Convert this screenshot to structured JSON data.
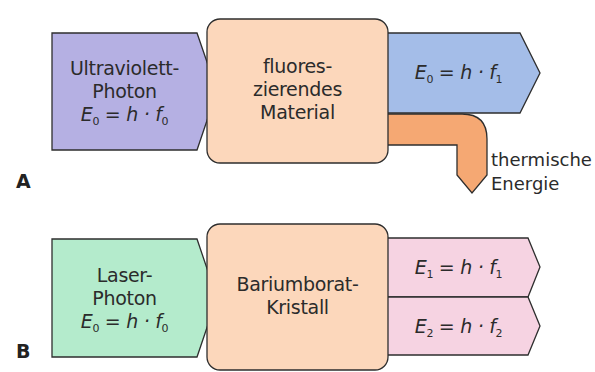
{
  "colors": {
    "uv_photon": "#b5b0e3",
    "material": "#fcd7bb",
    "emitted_photon": "#a4bde8",
    "thermal": "#f5a873",
    "laser_photon": "#b4ebcc",
    "output_photons": "#f6d3e2",
    "outline": "#2e2e2e"
  },
  "panel_a": {
    "label": "A",
    "input": {
      "line1": "Ultraviolett-",
      "line2": "Photon",
      "eq_var": "E",
      "eq_var_sub": "0",
      "eq_mid": " = h · ",
      "eq_f": "f",
      "eq_f_sub": "0"
    },
    "center": {
      "line1": "fluores-",
      "line2": "zierendes",
      "line3": "Material"
    },
    "output": {
      "eq_var": "E",
      "eq_var_sub": "0",
      "eq_mid": " = h · ",
      "eq_f": "f",
      "eq_f_sub": "1"
    },
    "thermal": {
      "line1": "thermische",
      "line2": "Energie"
    }
  },
  "panel_b": {
    "label": "B",
    "input": {
      "line1": "Laser-",
      "line2": "Photon",
      "eq_var": "E",
      "eq_var_sub": "0",
      "eq_mid": " = h · ",
      "eq_f": "f",
      "eq_f_sub": "0"
    },
    "center": {
      "line1": "Bariumborat-",
      "line2": "Kristall"
    },
    "output_1": {
      "eq_var": "E",
      "eq_var_sub": "1",
      "eq_mid": " = h · ",
      "eq_f": "f",
      "eq_f_sub": "1"
    },
    "output_2": {
      "eq_var": "E",
      "eq_var_sub": "2",
      "eq_mid": " = h · ",
      "eq_f": "f",
      "eq_f_sub": "2"
    }
  }
}
